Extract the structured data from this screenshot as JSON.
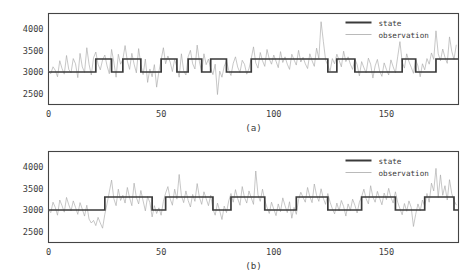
{
  "chart_data": [
    {
      "panel_id": "a",
      "type": "line",
      "title": "",
      "sub_label": "(a)",
      "xlabel": "",
      "ylabel": "",
      "xlim": [
        0,
        182
      ],
      "ylim": [
        2250,
        4350
      ],
      "xticks": [
        0,
        50,
        100,
        150
      ],
      "xtick_labels": [
        "0",
        "50",
        "100",
        "150"
      ],
      "yticks": [
        2500,
        3000,
        3500,
        4000
      ],
      "ytick_labels": [
        "2500",
        "3000",
        "3500",
        "4000"
      ],
      "grid": false,
      "legend": {
        "position": "upper-right",
        "entries": [
          {
            "name": "state",
            "color": "#3a3a3a",
            "width": 2.0
          },
          {
            "name": "observation",
            "color": "#a8a8a8",
            "width": 0.8
          }
        ]
      },
      "series": [
        {
          "name": "state",
          "style": "step",
          "color": "#3a3a3a",
          "levels": {
            "low": 3000,
            "high": 3300
          },
          "segments": [
            [
              0,
              21,
              3000
            ],
            [
              21,
              28,
              3300
            ],
            [
              28,
              33,
              3000
            ],
            [
              33,
              41,
              3300
            ],
            [
              41,
              50,
              3000
            ],
            [
              50,
              57,
              3300
            ],
            [
              57,
              62,
              3000
            ],
            [
              62,
              68,
              3300
            ],
            [
              68,
              72,
              3000
            ],
            [
              72,
              79,
              3300
            ],
            [
              79,
              90,
              3000
            ],
            [
              90,
              124,
              3300
            ],
            [
              124,
              128,
              3000
            ],
            [
              128,
              136,
              3300
            ],
            [
              136,
              157,
              3000
            ],
            [
              157,
              163,
              3300
            ],
            [
              163,
              172,
              3000
            ],
            [
              172,
              182,
              3300
            ]
          ]
        },
        {
          "name": "observation",
          "style": "line",
          "color": "#a8a8a8",
          "values": [
            3010,
            2960,
            3120,
            3040,
            2890,
            3260,
            3080,
            2950,
            3380,
            3060,
            2980,
            3310,
            3190,
            2870,
            3430,
            3120,
            2990,
            3560,
            3180,
            2930,
            3330,
            3460,
            3180,
            3050,
            3280,
            3390,
            3140,
            2960,
            3520,
            3230,
            2880,
            3410,
            3180,
            3290,
            3610,
            3250,
            3060,
            3430,
            3180,
            2980,
            3540,
            3170,
            2940,
            3300,
            2760,
            3070,
            2890,
            3170,
            2650,
            3010,
            3280,
            3560,
            3190,
            3370,
            3230,
            3010,
            3290,
            3110,
            2880,
            3420,
            3030,
            2930,
            3350,
            3500,
            3190,
            3070,
            3620,
            3240,
            2990,
            3420,
            3170,
            3300,
            3080,
            2940,
            3180,
            2480,
            3020,
            2880,
            3130,
            3260,
            3040,
            2920,
            3200,
            3350,
            3110,
            2990,
            3270,
            3180,
            2950,
            3080,
            3310,
            3580,
            3210,
            3090,
            3450,
            3260,
            3130,
            3520,
            3300,
            3180,
            3390,
            3250,
            3100,
            3470,
            3220,
            3350,
            3180,
            3060,
            3410,
            3280,
            3160,
            3500,
            3230,
            3340,
            3190,
            3080,
            3420,
            3260,
            3130,
            3550,
            3310,
            4160,
            3710,
            3280,
            3150,
            3020,
            3310,
            3190,
            3410,
            3270,
            3120,
            3480,
            3240,
            3350,
            3180,
            3060,
            3300,
            3170,
            2910,
            3240,
            3100,
            2980,
            3320,
            3180,
            2860,
            3140,
            3290,
            3020,
            2900,
            3210,
            3060,
            2930,
            3280,
            3120,
            2980,
            3350,
            3700,
            3230,
            3090,
            3420,
            3240,
            3110,
            2970,
            3280,
            3140,
            2890,
            3190,
            3050,
            3310,
            3180,
            3440,
            3290,
            3950,
            3420,
            3260,
            3530,
            3340,
            3200,
            3810,
            3480,
            3290,
            3620
          ]
        }
      ]
    },
    {
      "panel_id": "b",
      "type": "line",
      "title": "",
      "sub_label": "(b)",
      "xlabel": "",
      "ylabel": "",
      "xlim": [
        0,
        182
      ],
      "ylim": [
        2250,
        4350
      ],
      "xticks": [
        0,
        50,
        100,
        150
      ],
      "xtick_labels": [
        "0",
        "50",
        "100",
        "150"
      ],
      "yticks": [
        2500,
        3000,
        3500,
        4000
      ],
      "ytick_labels": [
        "2500",
        "3000",
        "3500",
        "4000"
      ],
      "grid": false,
      "legend": {
        "position": "upper-right",
        "entries": [
          {
            "name": "state",
            "color": "#3a3a3a",
            "width": 2.0
          },
          {
            "name": "observation",
            "color": "#a8a8a8",
            "width": 0.8
          }
        ]
      },
      "series": [
        {
          "name": "state",
          "style": "step",
          "color": "#3a3a3a",
          "levels": {
            "low": 3000,
            "high": 3300
          },
          "segments": [
            [
              0,
              25,
              3000
            ],
            [
              25,
              46,
              3300
            ],
            [
              46,
              52,
              3000
            ],
            [
              52,
              73,
              3300
            ],
            [
              73,
              81,
              3000
            ],
            [
              81,
              96,
              3300
            ],
            [
              96,
              110,
              3000
            ],
            [
              110,
              124,
              3300
            ],
            [
              124,
              139,
              3000
            ],
            [
              139,
              154,
              3300
            ],
            [
              154,
              167,
              3000
            ],
            [
              167,
              180,
              3300
            ],
            [
              180,
              182,
              3000
            ]
          ]
        },
        {
          "name": "observation",
          "style": "line",
          "color": "#a8a8a8",
          "values": [
            3000,
            2940,
            3180,
            3060,
            2880,
            3230,
            3100,
            2950,
            3290,
            3120,
            2980,
            3210,
            3060,
            2900,
            3170,
            3020,
            2860,
            3110,
            2790,
            2700,
            2760,
            2640,
            2830,
            2700,
            2580,
            2900,
            3150,
            3420,
            3690,
            3260,
            3100,
            3480,
            3220,
            3340,
            3160,
            3520,
            3280,
            3100,
            3620,
            3290,
            3140,
            3450,
            3210,
            2980,
            3310,
            3170,
            2840,
            3100,
            2920,
            3050,
            2880,
            3200,
            3390,
            3540,
            3260,
            3110,
            3480,
            3250,
            3820,
            3330,
            3170,
            3440,
            3220,
            3070,
            3360,
            3200,
            3610,
            3290,
            3130,
            3420,
            3260,
            3100,
            3340,
            3020,
            2880,
            3160,
            2980,
            2780,
            3090,
            2940,
            3210,
            3380,
            3180,
            3470,
            3260,
            3110,
            3540,
            3290,
            3160,
            3440,
            3280,
            3130,
            3900,
            3350,
            3200,
            3480,
            3220,
            3060,
            2920,
            3180,
            3020,
            2870,
            3140,
            2960,
            3280,
            3100,
            2940,
            3190,
            2810,
            3060,
            2900,
            3240,
            3410,
            3290,
            3180,
            3520,
            3310,
            3170,
            3600,
            3340,
            3200,
            3490,
            3270,
            3130,
            3380,
            3180,
            3030,
            2910,
            3160,
            2980,
            3220,
            3080,
            2860,
            3140,
            2990,
            3250,
            3110,
            2930,
            3180,
            3310,
            3480,
            3260,
            3140,
            3560,
            3300,
            3180,
            3430,
            3270,
            3120,
            3390,
            3240,
            3500,
            3290,
            3160,
            3420,
            3180,
            3030,
            2890,
            3150,
            2970,
            3210,
            3060,
            2620,
            2900,
            3140,
            2980,
            3230,
            3090,
            3380,
            3180,
            3620,
            3440,
            3960,
            3290,
            3810,
            3340,
            3560,
            3230,
            3700,
            3380,
            3220,
            3120
          ]
        }
      ]
    }
  ]
}
